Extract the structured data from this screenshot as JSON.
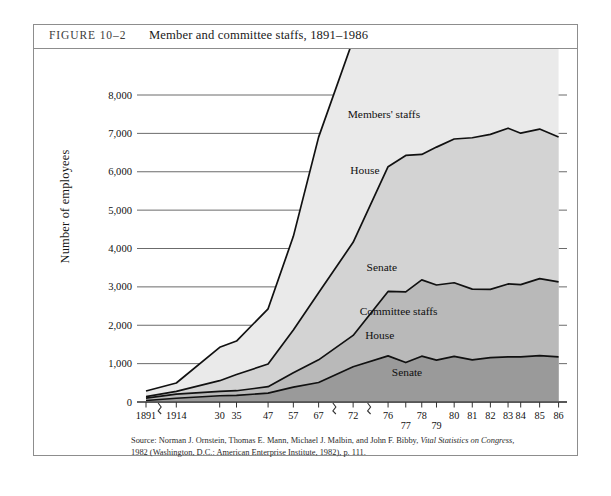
{
  "figure": {
    "label": "FIGURE 10–2",
    "title": "Member and committee staffs, 1891–1986"
  },
  "source": {
    "line1_a": "Source: Norman J. Ornstein, Thomas E. Mann, Michael J. Malbin, and John F. Bibby, ",
    "line1_italic": "Vital Statistics on Congress,",
    "line2": "1982 (Washington, D.C.: American Enterprise Institute, 1982), p. 111."
  },
  "chart_data": {
    "type": "area",
    "title": "Member and committee staffs, 1891–1986",
    "xlabel": "",
    "ylabel": "Number of employees",
    "ylim": [
      0,
      8000
    ],
    "ytick_labels": [
      "0",
      "1,000",
      "2,000",
      "3,000",
      "4,000",
      "5,000",
      "6,000",
      "7,000",
      "8,000"
    ],
    "ytick_values": [
      0,
      1000,
      2000,
      3000,
      4000,
      5000,
      6000,
      7000,
      8000
    ],
    "grid": true,
    "axis_breaks": [
      1,
      2,
      3
    ],
    "categories": [
      "1891",
      "1914",
      "30",
      "35",
      "47",
      "57",
      "67",
      "72",
      "76",
      "77",
      "78",
      "79",
      "80",
      "81",
      "82",
      "83",
      "84",
      "85",
      "86"
    ],
    "stacking_order": [
      "Committee staffs – Senate",
      "Committee staffs – House",
      "Members' staffs – Senate",
      "Members' staffs – House"
    ],
    "series": [
      {
        "name": "Committee staffs – Senate",
        "key": "committee_senate",
        "fill": "#9a9a9a",
        "values": [
          39,
          98,
          163,
          172,
          232,
          386,
          509,
          918,
          1201,
          1028,
          1194,
          1090,
          1191,
          1098,
          1156,
          1176,
          1178,
          1207,
          1178
        ]
      },
      {
        "name": "Committee staffs – House",
        "key": "committee_house",
        "fill": "#b9b9b9",
        "values": [
          62,
          105,
          112,
          122,
          167,
          375,
          589,
          817,
          1680,
          1843,
          1989,
          1959,
          1917,
          1843,
          1778,
          1900,
          1880,
          2009,
          1954
        ]
      },
      {
        "name": "Members' staffs – Senate",
        "key": "members_senate",
        "fill": "#d3d3d3",
        "values": [
          39,
          72,
          280,
          424,
          590,
          1115,
          1749,
          2426,
          3251,
          3554,
          3268,
          3593,
          3746,
          3945,
          4041,
          4059,
          3947,
          3896,
          3774
        ]
      },
      {
        "name": "Members' staffs – House",
        "key": "members_house",
        "fill": "#eaeaea",
        "values": [
          146,
          220,
          870,
          870,
          1440,
          2441,
          4055,
          5280,
          6939,
          6942,
          7000,
          7067,
          7371,
          7487,
          7511,
          7606,
          7176,
          7528,
          7920
        ]
      }
    ],
    "annotations": [
      {
        "text": "Members' staffs",
        "x_frac": 0.565,
        "y_value": 7400
      },
      {
        "text": "House",
        "x_frac": 0.52,
        "y_value": 5950
      },
      {
        "text": "Senate",
        "x_frac": 0.56,
        "y_value": 3420
      },
      {
        "text": "Committee staffs",
        "x_frac": 0.6,
        "y_value": 2260
      },
      {
        "text": "House",
        "x_frac": 0.555,
        "y_value": 1640
      },
      {
        "text": "Senate",
        "x_frac": 0.62,
        "y_value": 690
      }
    ]
  }
}
